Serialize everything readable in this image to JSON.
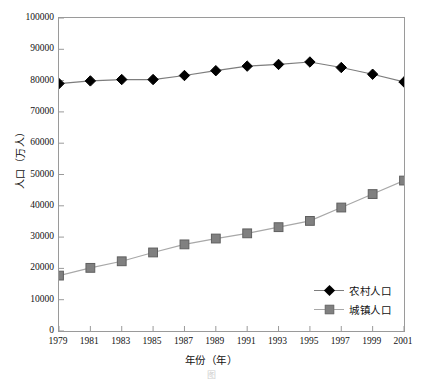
{
  "chart_data": {
    "type": "line",
    "title": "",
    "xlabel": "年份（年）",
    "ylabel": "人口（万人）",
    "categories": [
      1979,
      1981,
      1983,
      1985,
      1987,
      1989,
      1991,
      1993,
      1995,
      1997,
      1999,
      2001
    ],
    "xlim": [
      1979,
      2001
    ],
    "ylim": [
      0,
      100000
    ],
    "ytick_step": 10000,
    "yticks": [
      "100000",
      "90000",
      "80000",
      "70000",
      "60000",
      "50000",
      "40000",
      "30000",
      "20000",
      "10000",
      "0"
    ],
    "ytick_values": [
      100000,
      90000,
      80000,
      70000,
      60000,
      50000,
      40000,
      30000,
      20000,
      10000,
      0
    ],
    "xticks": [
      "1979",
      "1981",
      "1983",
      "1985",
      "1987",
      "1989",
      "1991",
      "1993",
      "1995",
      "1997",
      "1999",
      "2001"
    ],
    "grid": false,
    "legend_position": "lower-right",
    "series": [
      {
        "name": "农村人口",
        "marker": "diamond",
        "color": "#000000",
        "line_color": "#7d7d7d",
        "values": [
          79047,
          79901,
          80340,
          80340,
          81626,
          83164,
          84620,
          85166,
          85947,
          84177,
          82038,
          79563
        ]
      },
      {
        "name": "城镇人口",
        "marker": "square",
        "color": "#808080",
        "line_color": "#a8a8a8",
        "values": [
          17700,
          20171,
          22274,
          25094,
          27674,
          29540,
          31203,
          33173,
          35174,
          39449,
          43748,
          48064
        ]
      }
    ]
  },
  "legend": {
    "items": [
      {
        "label": "农村人口"
      },
      {
        "label": "城镇人口"
      }
    ]
  },
  "axes": {
    "x_title": "年份（年）",
    "y_title": "人口（万人）"
  },
  "caption": {
    "text": "图                                  "
  },
  "colors": {
    "rural_marker": "#000000",
    "urban_marker": "#808080",
    "rural_line": "#7d7d7d",
    "urban_line": "#a8a8a8",
    "frame": "#9a9a9a",
    "text": "#111111"
  }
}
